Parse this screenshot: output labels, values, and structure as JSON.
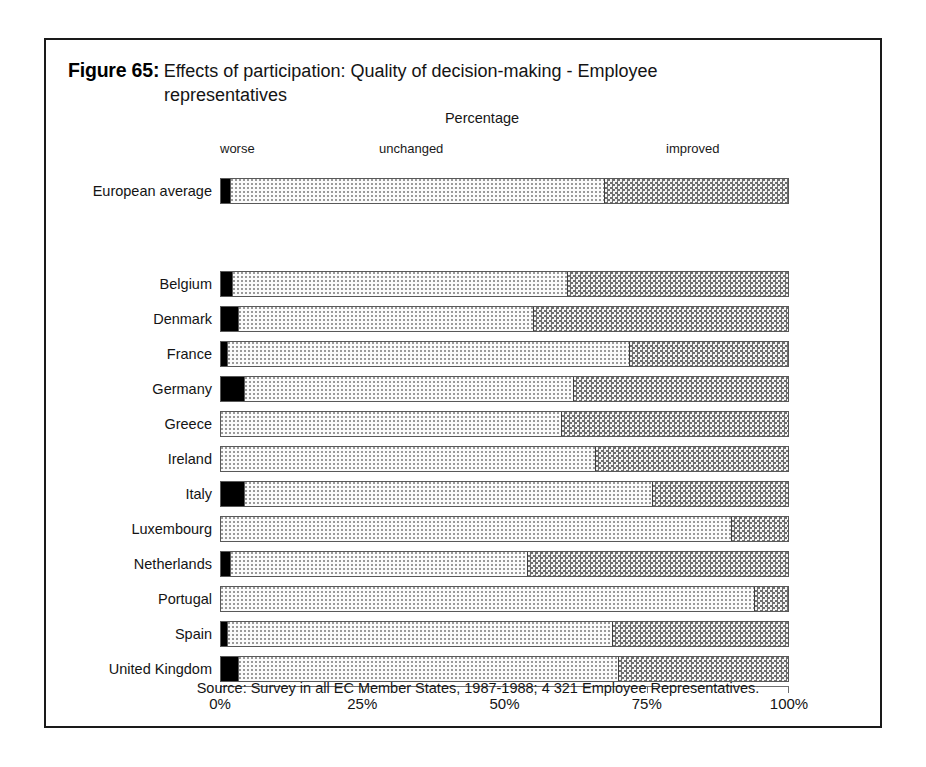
{
  "figure": {
    "label": "Figure 65:",
    "title_line1": "Effects of participation: Quality of decision-making - Employee",
    "title_line2": "representatives",
    "axis_caption": "Percentage",
    "source": "Source: Survey in all EC Member States, 1987-1988; 4 321 Employee Representatives."
  },
  "segment_headers": {
    "worse": "worse",
    "unchanged": "unchanged",
    "improved": "improved"
  },
  "axis": {
    "ticks": [
      "0%",
      "25%",
      "50%",
      "75%",
      "100%"
    ]
  },
  "chart_data": {
    "type": "bar",
    "orientation": "horizontal",
    "stacked": true,
    "normalized_percent": true,
    "title": "Figure 65: Effects of participation: Quality of decision-making - Employee representatives",
    "subtitle": "Percentage",
    "xlabel": "Percentage",
    "ylabel": "",
    "xlim": [
      0,
      100
    ],
    "xticks": [
      0,
      25,
      50,
      75,
      100
    ],
    "xticklabels": [
      "0%",
      "25%",
      "50%",
      "75%",
      "100%"
    ],
    "grid": false,
    "legend_position": "top-inline",
    "legend": [
      "worse",
      "unchanged",
      "improved"
    ],
    "categories": [
      "European average",
      "Belgium",
      "Denmark",
      "France",
      "Germany",
      "Greece",
      "Ireland",
      "Italy",
      "Luxembourg",
      "Netherlands",
      "Portugal",
      "Spain",
      "United Kingdom"
    ],
    "series": [
      {
        "name": "worse",
        "values": [
          1.5,
          2,
          3,
          1,
          4,
          0,
          0,
          4,
          0,
          1.5,
          0,
          1,
          3
        ]
      },
      {
        "name": "unchanged",
        "values": [
          66,
          59,
          52,
          71,
          58,
          60,
          66,
          72,
          90,
          52.5,
          94,
          68,
          67
        ]
      },
      {
        "name": "improved",
        "values": [
          32.5,
          39,
          45,
          28,
          38,
          40,
          34,
          24,
          10,
          46,
          6,
          31,
          30
        ]
      }
    ],
    "annotation": "Source: Survey in all EC Member States, 1987-1988; 4 321 Employee Representatives."
  },
  "rows": [
    {
      "label": "European average",
      "worse": 1.5,
      "unchanged": 66,
      "improved": 32.5,
      "y": 138
    },
    {
      "label": "Belgium",
      "worse": 2,
      "unchanged": 59,
      "improved": 39,
      "y": 231
    },
    {
      "label": "Denmark",
      "worse": 3,
      "unchanged": 52,
      "improved": 45,
      "y": 266
    },
    {
      "label": "France",
      "worse": 1,
      "unchanged": 71,
      "improved": 28,
      "y": 301
    },
    {
      "label": "Germany",
      "worse": 4,
      "unchanged": 58,
      "improved": 38,
      "y": 336
    },
    {
      "label": "Greece",
      "worse": 0,
      "unchanged": 60,
      "improved": 40,
      "y": 371
    },
    {
      "label": "Ireland",
      "worse": 0,
      "unchanged": 66,
      "improved": 34,
      "y": 406
    },
    {
      "label": "Italy",
      "worse": 4,
      "unchanged": 72,
      "improved": 24,
      "y": 441
    },
    {
      "label": "Luxembourg",
      "worse": 0,
      "unchanged": 90,
      "improved": 10,
      "y": 476
    },
    {
      "label": "Netherlands",
      "worse": 1.5,
      "unchanged": 52.5,
      "improved": 46,
      "y": 511
    },
    {
      "label": "Portugal",
      "worse": 0,
      "unchanged": 94,
      "improved": 6,
      "y": 546
    },
    {
      "label": "Spain",
      "worse": 1,
      "unchanged": 68,
      "improved": 31,
      "y": 581
    },
    {
      "label": "United Kingdom",
      "worse": 3,
      "unchanged": 67,
      "improved": 30,
      "y": 616
    }
  ]
}
